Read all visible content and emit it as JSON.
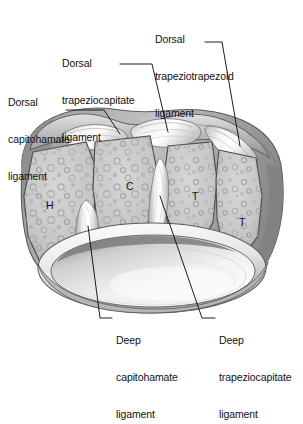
{
  "figure": {
    "background_color": "#ffffff",
    "ink_color": "#121212",
    "bone_fill": "#c9c9c9",
    "bone_shadow": "#9a9a9a",
    "ligament_highlight": "#f4f4f4",
    "cavity_fill": "#efefef"
  },
  "labels": {
    "dorsal_capitohamate": {
      "line1": "Dorsal",
      "line2": "capitohamate",
      "line3": "ligament",
      "x": 8,
      "y": 72
    },
    "dorsal_trapeziocapitate": {
      "line1": "Dorsal",
      "line2": "trapeziocapitate",
      "line3": "ligament",
      "x": 62,
      "y": 33
    },
    "dorsal_trapeziotrapezoid": {
      "line1": "Dorsal",
      "line2": "trapeziotrapezoid",
      "line3": "ligament",
      "x": 155,
      "y": 9
    },
    "deep_capitohamate": {
      "line1": "Deep",
      "line2": "capitohamate",
      "line3": "ligament",
      "x": 116,
      "y": 310
    },
    "deep_trapeziocapitate": {
      "line1": "Deep",
      "line2": "trapeziocapitate",
      "line3": "ligament",
      "x": 219,
      "y": 310
    }
  },
  "bone_labels": [
    {
      "text": "H",
      "name": "hamate",
      "x": 46,
      "y": 199
    },
    {
      "text": "C",
      "name": "capitate",
      "x": 126,
      "y": 180
    },
    {
      "text": "T",
      "name": "trapezoid",
      "x": 192,
      "y": 190
    },
    {
      "text": "T",
      "name": "trapezium",
      "x": 239,
      "y": 216
    }
  ]
}
